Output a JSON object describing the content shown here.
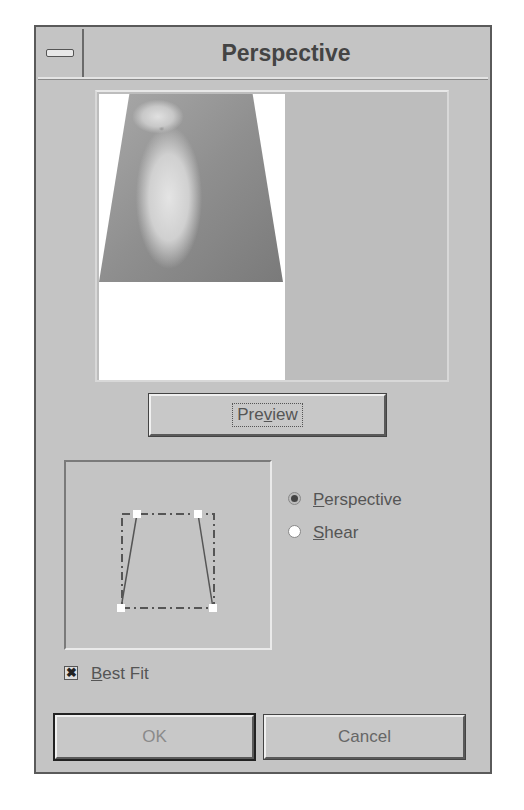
{
  "dialog": {
    "title": "Perspective",
    "system_menu_icon": "system-menu-icon"
  },
  "preview": {
    "image_description": "Dalmatian dog photo, perspective-transformed into trapezoid",
    "button_label_pre": "Pre",
    "button_label_mnemonic": "v",
    "button_label_post": "iew"
  },
  "editor": {
    "handles": [
      {
        "x": 71,
        "y": 52
      },
      {
        "x": 132,
        "y": 52
      },
      {
        "x": 55,
        "y": 146
      },
      {
        "x": 147,
        "y": 146
      }
    ],
    "bounding_box": {
      "x": 56,
      "y": 52,
      "w": 92,
      "h": 94
    }
  },
  "mode": {
    "options": [
      {
        "mnemonic": "P",
        "rest": "erspective",
        "selected": true
      },
      {
        "mnemonic": "S",
        "rest": "hear",
        "selected": false
      }
    ]
  },
  "best_fit": {
    "mnemonic": "B",
    "rest": "est Fit",
    "checked": true,
    "check_glyph": "✖"
  },
  "buttons": {
    "ok": "OK",
    "cancel": "Cancel"
  }
}
